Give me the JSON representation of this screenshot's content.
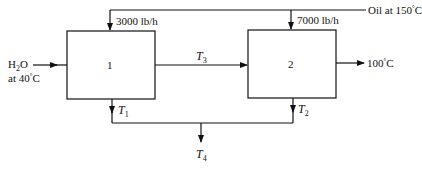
{
  "diagram": {
    "type": "process-flow",
    "units": [
      {
        "id": "unit-1",
        "label": "1"
      },
      {
        "id": "unit-2",
        "label": "2"
      }
    ],
    "streams": {
      "oil_inlet": {
        "text": "Oil at 150",
        "deg": "°",
        "unit": "C"
      },
      "oil_to_unit1": {
        "text": "3000 lb/h"
      },
      "oil_to_unit2": {
        "text": "7000 lb/h"
      },
      "water_inlet": {
        "formula_h": "H",
        "formula_sub": "2",
        "formula_o": "O",
        "temp_prefix": "at 40",
        "deg": "°",
        "unit": "C"
      },
      "water_between": {
        "symbol": "T",
        "sub": "3"
      },
      "water_outlet": {
        "text": "100",
        "deg": "°",
        "unit": "C"
      },
      "oil_out_unit1": {
        "symbol": "T",
        "sub": "1"
      },
      "oil_out_unit2": {
        "symbol": "T",
        "sub": "2"
      },
      "oil_mixed": {
        "symbol": "T",
        "sub": "4"
      }
    },
    "colors": {
      "line": "#111111",
      "background": "#ffffff"
    }
  }
}
